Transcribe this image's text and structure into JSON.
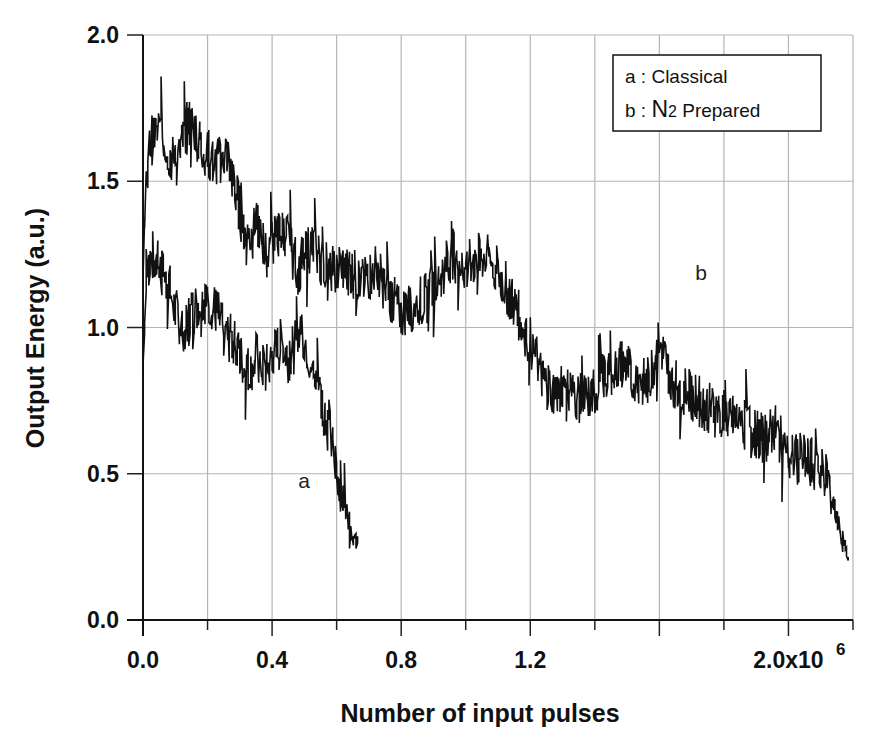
{
  "chart_data": {
    "type": "line",
    "title": "",
    "xlabel": "Number of input pulses",
    "ylabel": "Output Energy (a.u.)",
    "x_multiplier_label": "6",
    "xlim": [
      0,
      2.2
    ],
    "ylim": [
      0,
      2.0
    ],
    "x_ticks": [
      0.0,
      0.2,
      0.4,
      0.6,
      0.8,
      1.0,
      1.2,
      1.4,
      1.6,
      1.8,
      2.0,
      2.2
    ],
    "x_tick_labels": [
      "0.0",
      "",
      "0.4",
      "",
      "0.8",
      "",
      "1.2",
      "",
      "",
      "",
      "2.0x10",
      ""
    ],
    "y_ticks": [
      0.0,
      0.5,
      1.0,
      1.5,
      2.0
    ],
    "y_tick_labels": [
      "0.0",
      "0.5",
      "1.0",
      "1.5",
      "2.0"
    ],
    "grid": true,
    "legend_position": "upper right",
    "legend": [
      {
        "key": "a",
        "sep": " : ",
        "label": "Classical"
      },
      {
        "key": "b",
        "sep": " : ",
        "label_main": "N",
        "label_sub": "2",
        "label_rest": " Prepared"
      }
    ],
    "annotations": [
      {
        "text": "a",
        "x": 0.5,
        "y": 0.48
      },
      {
        "text": "b",
        "x": 1.73,
        "y": 1.12
      }
    ],
    "series": [
      {
        "name": "a : Classical",
        "x": [
          0.0,
          0.01,
          0.03,
          0.05,
          0.08,
          0.1,
          0.13,
          0.15,
          0.18,
          0.2,
          0.23,
          0.25,
          0.28,
          0.3,
          0.33,
          0.35,
          0.38,
          0.4,
          0.43,
          0.45,
          0.48,
          0.5,
          0.52,
          0.54,
          0.56,
          0.58,
          0.6,
          0.62,
          0.64,
          0.66,
          0.67
        ],
        "y": [
          0.85,
          1.2,
          1.25,
          1.2,
          1.15,
          1.05,
          1.0,
          1.05,
          1.1,
          1.1,
          1.05,
          0.98,
          0.95,
          0.9,
          0.85,
          0.9,
          0.85,
          0.9,
          0.95,
          0.9,
          0.95,
          0.97,
          0.88,
          0.82,
          0.72,
          0.63,
          0.52,
          0.42,
          0.33,
          0.26,
          0.24
        ]
      },
      {
        "name": "b : N2 Prepared",
        "x": [
          0.0,
          0.01,
          0.02,
          0.04,
          0.06,
          0.08,
          0.1,
          0.12,
          0.14,
          0.16,
          0.18,
          0.2,
          0.22,
          0.24,
          0.26,
          0.28,
          0.3,
          0.32,
          0.34,
          0.36,
          0.38,
          0.4,
          0.44,
          0.48,
          0.52,
          0.56,
          0.6,
          0.64,
          0.68,
          0.72,
          0.76,
          0.8,
          0.84,
          0.88,
          0.92,
          0.96,
          1.0,
          1.04,
          1.08,
          1.12,
          1.16,
          1.2,
          1.24,
          1.28,
          1.32,
          1.36,
          1.4,
          1.44,
          1.48,
          1.52,
          1.56,
          1.6,
          1.64,
          1.68,
          1.72,
          1.76,
          1.8,
          1.84,
          1.88,
          1.92,
          1.96,
          2.0,
          2.04,
          2.08,
          2.12,
          2.14,
          2.16,
          2.18,
          2.19
        ],
        "y": [
          1.2,
          1.45,
          1.62,
          1.68,
          1.66,
          1.6,
          1.55,
          1.62,
          1.7,
          1.68,
          1.62,
          1.6,
          1.55,
          1.58,
          1.6,
          1.5,
          1.4,
          1.3,
          1.32,
          1.35,
          1.25,
          1.3,
          1.33,
          1.2,
          1.28,
          1.22,
          1.18,
          1.2,
          1.15,
          1.2,
          1.12,
          1.05,
          1.08,
          1.1,
          1.18,
          1.25,
          1.2,
          1.25,
          1.22,
          1.15,
          1.05,
          0.95,
          0.82,
          0.78,
          0.8,
          0.75,
          0.78,
          0.85,
          0.88,
          0.84,
          0.8,
          0.95,
          0.82,
          0.78,
          0.75,
          0.72,
          0.7,
          0.68,
          0.66,
          0.62,
          0.65,
          0.55,
          0.55,
          0.53,
          0.5,
          0.4,
          0.3,
          0.22,
          0.18
        ]
      }
    ]
  }
}
